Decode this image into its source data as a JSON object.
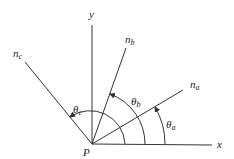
{
  "diagram": {
    "origin_label": "P",
    "axes": {
      "x_label": "x",
      "y_label": "y"
    },
    "vectors": [
      {
        "id": "na",
        "label": "n",
        "subscript": "a"
      },
      {
        "id": "nb",
        "label": "n",
        "subscript": "b"
      },
      {
        "id": "nc",
        "label": "n",
        "subscript": "c"
      }
    ],
    "angles": [
      {
        "id": "theta_a",
        "label": "θ",
        "subscript": "a"
      },
      {
        "id": "theta_b",
        "label": "θ",
        "subscript": "b"
      },
      {
        "id": "theta_c",
        "label": "θ",
        "subscript": "c"
      }
    ],
    "colors": {
      "stroke": "#333333",
      "text": "#222222"
    }
  }
}
